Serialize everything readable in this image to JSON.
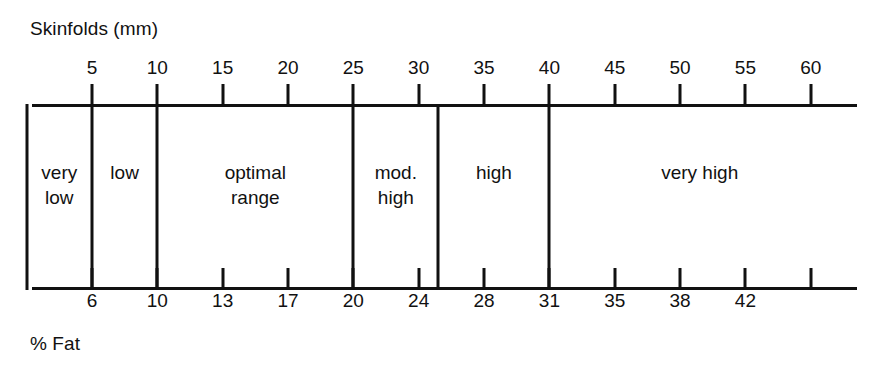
{
  "figure": {
    "top_axis_title": "Skinfolds (mm)",
    "bottom_axis_title": "% Fat"
  },
  "chart_data": {
    "type": "table",
    "title": "Skinfolds (mm)",
    "xlabel": "Skinfolds (mm)",
    "ylabel": "",
    "secondary_xlabel": "% Fat",
    "grid": false,
    "legend": "none",
    "axis_range_mm": [
      0,
      63
    ],
    "top_axis": {
      "label": "Skinfolds (mm)",
      "unit": "mm",
      "ticks": [
        {
          "value": 5,
          "label": "5"
        },
        {
          "value": 10,
          "label": "10"
        },
        {
          "value": 15,
          "label": "15"
        },
        {
          "value": 20,
          "label": "20"
        },
        {
          "value": 25,
          "label": "25"
        },
        {
          "value": 30,
          "label": "30"
        },
        {
          "value": 35,
          "label": "35"
        },
        {
          "value": 40,
          "label": "40"
        },
        {
          "value": 45,
          "label": "45"
        },
        {
          "value": 50,
          "label": "50"
        },
        {
          "value": 55,
          "label": "55"
        },
        {
          "value": 60,
          "label": "60"
        }
      ]
    },
    "bottom_axis": {
      "label": "% Fat",
      "unit": "%",
      "ticks": [
        {
          "at_mm": 5,
          "label": "6"
        },
        {
          "at_mm": 10,
          "label": "10"
        },
        {
          "at_mm": 15,
          "label": "13"
        },
        {
          "at_mm": 20,
          "label": "17"
        },
        {
          "at_mm": 25,
          "label": "20"
        },
        {
          "at_mm": 30,
          "label": "24"
        },
        {
          "at_mm": 35,
          "label": "28"
        },
        {
          "at_mm": 40,
          "label": "31"
        },
        {
          "at_mm": 45,
          "label": "35"
        },
        {
          "at_mm": 50,
          "label": "38"
        },
        {
          "at_mm": 55,
          "label": "42"
        },
        {
          "at_mm": 60,
          "label": ""
        }
      ]
    },
    "categories": [
      {
        "label": "very\nlow",
        "start_mm": 0,
        "end_mm": 5
      },
      {
        "label": "low",
        "start_mm": 5,
        "end_mm": 10
      },
      {
        "label": "optimal\nrange",
        "start_mm": 10,
        "end_mm": 25
      },
      {
        "label": "mod.\nhigh",
        "start_mm": 25,
        "end_mm": 31.5
      },
      {
        "label": "high",
        "start_mm": 31.5,
        "end_mm": 40
      },
      {
        "label": "very high",
        "start_mm": 40,
        "end_mm": 63
      }
    ],
    "dividers_mm": [
      0,
      5,
      10,
      25,
      31.5,
      40
    ],
    "colors": {
      "line": "#111111",
      "background": "#ffffff",
      "text": "#111111"
    }
  }
}
